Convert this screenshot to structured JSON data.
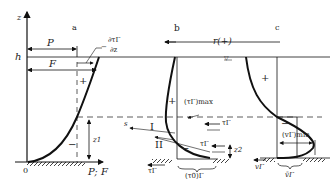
{
  "diagram": {
    "panels": [
      {
        "id": "a",
        "label": "a"
      },
      {
        "id": "b",
        "label": "b"
      },
      {
        "id": "c",
        "label": "c"
      }
    ],
    "axis": {
      "vertical_label": "z",
      "horizontal_label": "P; F",
      "origin_label": "0",
      "surface_label": "h"
    },
    "panel_a": {
      "pressure_label": "P",
      "force_label": "F",
      "gradient_label_num": "∂τΓ",
      "gradient_label_den": "∂z",
      "gradient_sign": "−",
      "plus_sign": "+",
      "minus_sign": "−",
      "height_label": "z1"
    },
    "panel_b": {
      "wind_label": "r(+)",
      "water_surface_symbol": "▽",
      "max_label": "(τΓ)max",
      "zone_1": "I",
      "zone_2": "II",
      "s_label": "s",
      "tau_label": "τΓ",
      "tau_label_2": "τΓ",
      "bottom_tau_label": "τΓ",
      "bottom_stress_label": "(τ0)Γ",
      "height_label": "z2",
      "plus_sign": "+",
      "minus_sign": "−"
    },
    "panel_c": {
      "plus_sign": "+",
      "minus_sign": "−",
      "min_label": "(vΓ)min",
      "mean_label": "v̄Γ",
      "bottom_v_label": "vΓ"
    },
    "colors": {
      "line": "#111111",
      "dashed": "#333333",
      "background": "#ffffff"
    }
  }
}
